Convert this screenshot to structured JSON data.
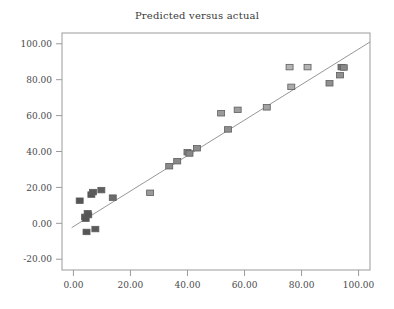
{
  "chart_data": {
    "type": "scatter",
    "title": "Predicted versus actual",
    "xlabel": "",
    "ylabel": "",
    "xlim": [
      -4.0,
      104.0
    ],
    "ylim": [
      -26.0,
      106.0
    ],
    "grid": false,
    "legend": "none",
    "x_ticks": [
      0,
      20,
      40,
      60,
      80,
      100
    ],
    "y_ticks": [
      -20,
      0,
      20,
      40,
      60,
      80,
      100
    ],
    "x_tick_labels": [
      "0.00",
      "20.00",
      "40.00",
      "60.00",
      "80.00",
      "100.00"
    ],
    "y_tick_labels": [
      "-20.00",
      "0.00",
      "20.00",
      "40.00",
      "60.00",
      "80.00",
      "100.00"
    ],
    "marker": "square",
    "series": [
      {
        "name": "Predicted versus actual",
        "points": [
          {
            "x": 2.2,
            "y": 12.6,
            "shade": "#555555"
          },
          {
            "x": 4.1,
            "y": 3.6,
            "shade": "#555555"
          },
          {
            "x": 4.3,
            "y": 2.6,
            "shade": "#555555"
          },
          {
            "x": 4.6,
            "y": -4.8,
            "shade": "#555555"
          },
          {
            "x": 5.0,
            "y": 5.6,
            "shade": "#555555"
          },
          {
            "x": 5.2,
            "y": 4.6,
            "shade": "#555555"
          },
          {
            "x": 6.3,
            "y": 16.0,
            "shade": "#555555"
          },
          {
            "x": 6.9,
            "y": 17.4,
            "shade": "#5a5a5a"
          },
          {
            "x": 7.7,
            "y": -3.2,
            "shade": "#5a5a5a"
          },
          {
            "x": 9.8,
            "y": 18.5,
            "shade": "#5f5f5f"
          },
          {
            "x": 13.8,
            "y": 14.3,
            "shade": "#6b6b6b"
          },
          {
            "x": 26.9,
            "y": 17.0,
            "shade": "#9a9a9a"
          },
          {
            "x": 33.6,
            "y": 31.8,
            "shade": "#8a8a8a"
          },
          {
            "x": 36.4,
            "y": 34.6,
            "shade": "#8a8a8a"
          },
          {
            "x": 40.0,
            "y": 39.6,
            "shade": "#878787"
          },
          {
            "x": 40.7,
            "y": 38.9,
            "shade": "#878787"
          },
          {
            "x": 43.3,
            "y": 41.8,
            "shade": "#8d8d8d"
          },
          {
            "x": 51.8,
            "y": 61.3,
            "shade": "#9a9a9a"
          },
          {
            "x": 54.2,
            "y": 52.3,
            "shade": "#8f8f8f"
          },
          {
            "x": 57.6,
            "y": 63.2,
            "shade": "#9e9e9e"
          },
          {
            "x": 67.8,
            "y": 64.6,
            "shade": "#a3a3a3"
          },
          {
            "x": 75.8,
            "y": 87.0,
            "shade": "#b4b4b4"
          },
          {
            "x": 76.4,
            "y": 76.0,
            "shade": "#aaaaaa"
          },
          {
            "x": 82.1,
            "y": 87.0,
            "shade": "#b4b4b4"
          },
          {
            "x": 89.8,
            "y": 78.0,
            "shade": "#8f8f8f"
          },
          {
            "x": 93.5,
            "y": 82.5,
            "shade": "#909090"
          },
          {
            "x": 94.0,
            "y": 87.0,
            "shade": "#757575"
          },
          {
            "x": 94.8,
            "y": 86.8,
            "shade": "#8a8a8a"
          }
        ]
      }
    ],
    "fit_line": {
      "x0": -0.6,
      "y0": -2.4,
      "x1": 104.0,
      "y1": 101.0,
      "color": "#8a8a8a"
    }
  },
  "axes": {
    "frame_color": "#9b9b9b",
    "background": "#ffffff"
  }
}
